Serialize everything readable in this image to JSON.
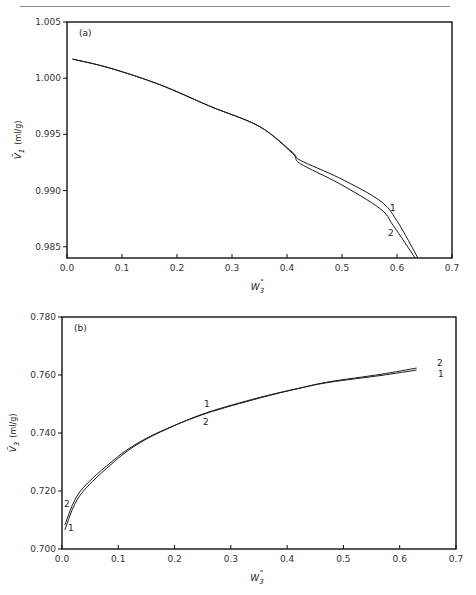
{
  "chart_data": [
    {
      "type": "line",
      "panel": "(a)",
      "title": "",
      "xlabel": "W3°",
      "ylabel": "V̄1 (ml/g)",
      "xlim": [
        0.0,
        0.7
      ],
      "ylim": [
        0.984,
        1.005
      ],
      "xticks": [
        "0.0",
        "0.1",
        "0.2",
        "0.3",
        "0.4",
        "0.5",
        "0.6",
        "0.7"
      ],
      "yticks": [
        "1.005",
        "1.000",
        "0.995",
        "0.990",
        "0.985"
      ],
      "grid": false,
      "series": [
        {
          "name": "1",
          "x": [
            0.01,
            0.078,
            0.17,
            0.26,
            0.35,
            0.41,
            0.424,
            0.496,
            0.569,
            0.6,
            0.638
          ],
          "y": [
            1.0017,
            1.0009,
            0.9994,
            0.9975,
            0.9957,
            0.9934,
            0.9927,
            0.9911,
            0.9891,
            0.9873,
            0.984
          ]
        },
        {
          "name": "2",
          "x": [
            0.01,
            0.078,
            0.17,
            0.26,
            0.35,
            0.41,
            0.424,
            0.496,
            0.569,
            0.593,
            0.633
          ],
          "y": [
            1.0017,
            1.0009,
            0.9994,
            0.9975,
            0.9957,
            0.9933,
            0.9924,
            0.9906,
            0.9884,
            0.9869,
            0.984
          ]
        }
      ]
    },
    {
      "type": "line",
      "panel": "(b)",
      "title": "",
      "xlabel": "W3°",
      "ylabel": "V̄3 (ml/g)",
      "xlim": [
        0.0,
        0.7
      ],
      "ylim": [
        0.7,
        0.78
      ],
      "xticks": [
        "0.0",
        "0.1",
        "0.2",
        "0.3",
        "0.4",
        "0.5",
        "0.6",
        "0.7"
      ],
      "yticks": [
        "0.780",
        "0.760",
        "0.740",
        "0.720",
        "0.700"
      ],
      "grid": false,
      "series": [
        {
          "name": "1",
          "x": [
            0.005,
            0.032,
            0.094,
            0.139,
            0.19,
            0.257,
            0.35,
            0.423,
            0.476,
            0.565,
            0.63
          ],
          "y": [
            0.7066,
            0.7185,
            0.7303,
            0.7367,
            0.7417,
            0.747,
            0.7522,
            0.7555,
            0.7575,
            0.7598,
            0.7617
          ]
        },
        {
          "name": "2",
          "x": [
            0.005,
            0.032,
            0.094,
            0.139,
            0.19,
            0.257,
            0.35,
            0.423,
            0.476,
            0.565,
            0.63
          ],
          "y": [
            0.7083,
            0.7198,
            0.731,
            0.737,
            0.7418,
            0.7468,
            0.752,
            0.7555,
            0.7577,
            0.7602,
            0.7624
          ]
        }
      ]
    }
  ],
  "panels": {
    "a": {
      "label": "(a)",
      "ylabel_main": "V̄",
      "ylabel_sub": "1",
      "ylabel_unit": "(ml/g)",
      "xlabel_main": "W",
      "xlabel_sub": "3",
      "xlabel_sup": "°",
      "curve_labels": [
        "1",
        "2"
      ]
    },
    "b": {
      "label": "(b)",
      "ylabel_main": "V̄",
      "ylabel_sub": "3",
      "ylabel_unit": "(ml/g)",
      "xlabel_main": "W",
      "xlabel_sub": "3",
      "xlabel_sup": "°",
      "curve_labels": [
        "1",
        "2",
        "2",
        "1",
        "1",
        "2"
      ]
    }
  }
}
